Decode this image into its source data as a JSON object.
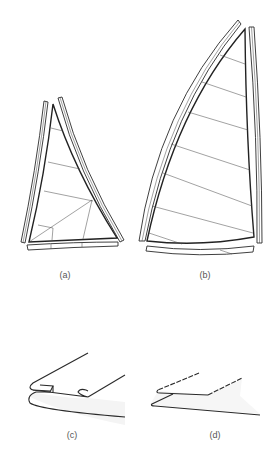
{
  "figure": {
    "panels": [
      {
        "id": "a",
        "label": "(a)",
        "description": "Small sail with curved luff and leech battens, horizontal seams and radial reinforcement lines at the clew"
      },
      {
        "id": "b",
        "label": "(b)",
        "description": "Tall sail with curved luff and straight leech battens, diagonal seams"
      },
      {
        "id": "c",
        "label": "(c)",
        "description": "Rolled/folded hem seam detail"
      },
      {
        "id": "d",
        "label": "(d)",
        "description": "Overlapped flat seam detail"
      }
    ]
  }
}
